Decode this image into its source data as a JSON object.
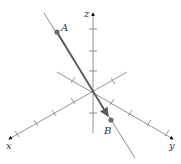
{
  "diagram": {
    "type": "3d-coordinate-axes-with-vector",
    "axes": {
      "x": {
        "label": "x"
      },
      "y": {
        "label": "y"
      },
      "z": {
        "label": "z"
      }
    },
    "points": {
      "A": {
        "label": "A"
      },
      "B": {
        "label": "B"
      }
    },
    "vector": {
      "from": "A",
      "to": "B",
      "description": "vector from A to B along a line through the origin"
    },
    "colors": {
      "axis": "#777777",
      "vector": "#5a5a5a",
      "point": "#6b6b6b",
      "line": "#8a8a8a",
      "text": "#333333"
    }
  }
}
